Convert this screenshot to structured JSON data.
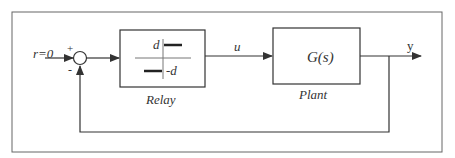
{
  "diagram": {
    "input_label": "r=0",
    "sum_plus": "+",
    "sum_minus": "-",
    "relay": {
      "name": "Relay",
      "upper_level": "d",
      "lower_level": "-d"
    },
    "control_signal": "u",
    "plant": {
      "name": "Plant",
      "transfer_function": "G(s)"
    },
    "output_label": "y",
    "colors": {
      "line": "#333333",
      "frame": "#666666",
      "background": "#ffffff"
    }
  }
}
